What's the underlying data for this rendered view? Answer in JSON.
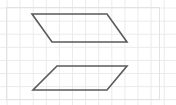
{
  "figure": {
    "canvas": {
      "width": 176,
      "height": 105,
      "background_color": "#ffffff"
    },
    "grid": {
      "visible": true,
      "cell_size": 13.1,
      "origin_x": 7.0,
      "origin_y": 8.0,
      "line_color": "#ebebeb",
      "line_width": 1,
      "label": "graph paper grid"
    },
    "border": {
      "visible": true,
      "color": "#e2e2e2",
      "line_width": 1,
      "x": 6.5,
      "y": 7.5,
      "width": 153,
      "height": 92
    },
    "stroke": {
      "color": "#5a5a5a",
      "width": 1.6,
      "fill": "none"
    },
    "shapes": [
      {
        "name": "parallelogram-top",
        "label": "Top parallelogram",
        "points": "32,14 107,14 127,42 52,42",
        "vertices": [
          {
            "name": "top-left",
            "x": 32,
            "y": 14
          },
          {
            "name": "top-right",
            "x": 107,
            "y": 14
          },
          {
            "name": "bottom-right",
            "x": 127,
            "y": 42
          },
          {
            "name": "bottom-left",
            "x": 52,
            "y": 42
          }
        ],
        "slant_direction": "down-right",
        "base_length_px": 75,
        "height_px": 28
      },
      {
        "name": "parallelogram-bottom",
        "label": "Bottom parallelogram",
        "points": "57,66 127,66 107,90 33,90",
        "vertices": [
          {
            "name": "top-left",
            "x": 57,
            "y": 66
          },
          {
            "name": "top-right",
            "x": 127,
            "y": 66
          },
          {
            "name": "bottom-right",
            "x": 107,
            "y": 90
          },
          {
            "name": "bottom-left",
            "x": 33,
            "y": 90
          }
        ],
        "slant_direction": "up-right",
        "base_length_px": 74,
        "height_px": 24
      }
    ]
  }
}
